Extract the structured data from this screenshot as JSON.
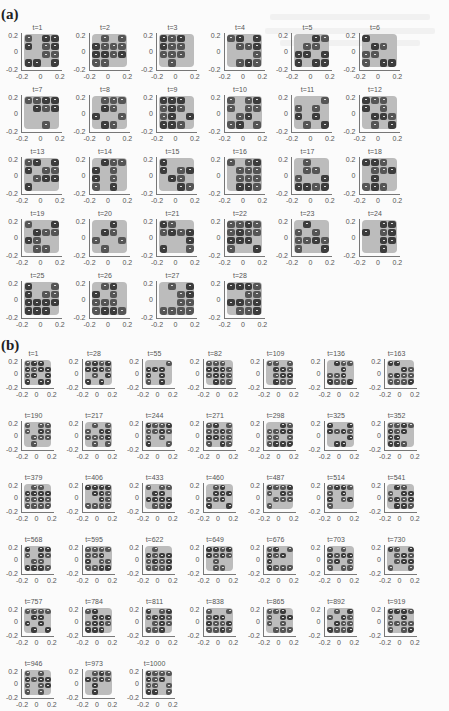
{
  "figure": {
    "panels": [
      {
        "label": "(a)",
        "frames": [
          "t=1",
          "t=2",
          "t=3",
          "t=4",
          "t=5",
          "t=6",
          "t=7",
          "t=8",
          "t=9",
          "t=10",
          "t=11",
          "t=12",
          "t=13",
          "t=14",
          "t=15",
          "t=16",
          "t=17",
          "t=18",
          "t=19",
          "t=20",
          "t=21",
          "t=22",
          "t=23",
          "t=24",
          "t=25",
          "t=26",
          "t=27",
          "t=28"
        ],
        "columns": 6
      },
      {
        "label": "(b)",
        "frames": [
          "t=1",
          "t=28",
          "t=55",
          "t=82",
          "t=109",
          "t=136",
          "t=163",
          "t=190",
          "t=217",
          "t=244",
          "t=271",
          "t=298",
          "t=325",
          "t=352",
          "t=379",
          "t=406",
          "t=433",
          "t=460",
          "t=487",
          "t=514",
          "t=541",
          "t=568",
          "t=595",
          "t=622",
          "t=649",
          "t=676",
          "t=703",
          "t=730",
          "t=757",
          "t=784",
          "t=811",
          "t=838",
          "t=865",
          "t=892",
          "t=919",
          "t=946",
          "t=973",
          "t=1000"
        ],
        "columns": 7
      }
    ],
    "axes": {
      "y_ticks": [
        "0.2",
        "0",
        "-0.2"
      ],
      "x_ticks": [
        "-0.2",
        "0",
        "0.2"
      ]
    },
    "colors": {
      "background": "#bcbcbc",
      "occupied": "#3c3c3c",
      "marker": "#dddddd",
      "axis": "#777777"
    }
  }
}
